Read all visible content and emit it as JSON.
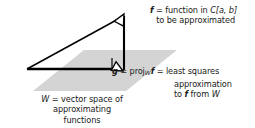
{
  "figure": {
    "background_color": "#ffffff",
    "plane_fill_color": "#d4d4d4",
    "stroke_color": "#000000",
    "text_color": "#1a1a1a"
  },
  "annotations": {
    "f_label": {
      "name": "f-annotation",
      "line1_vector": "f",
      "line1_rest": " = function in ",
      "line1_space": "C",
      "line1_interval": "[a, b]",
      "line2": "to be approximated"
    },
    "g_label": {
      "name": "g-annotation",
      "line1_vector": "g",
      "line1_eq1": " = proj",
      "line1_sub": "W",
      "line1_vector2": "f",
      "line1_eq2": " = least squares",
      "line2": "approximation",
      "line3_pre": "to ",
      "line3_vector": "f",
      "line3_mid": " from ",
      "line3_space": "W"
    },
    "w_label": {
      "name": "w-annotation",
      "line1_space": "W",
      "line1_rest": " = vector space of",
      "line2": "approximating",
      "line3": "functions"
    }
  },
  "geometry": {
    "plane_name": "subspace-plane-W",
    "plane_points": "33,91 84,50 177,50 126,91",
    "origin_point": {
      "x": 27,
      "y": 69
    },
    "f_tip_point": {
      "x": 124,
      "y": 14
    },
    "g_tip_point": {
      "x": 124,
      "y": 69
    },
    "vector_f_name": "vector-f-arrow",
    "vector_g_name": "vector-g-projection-arrow",
    "connector_name": "perpendicular-connector",
    "right_angle_name": "right-angle-marker"
  }
}
